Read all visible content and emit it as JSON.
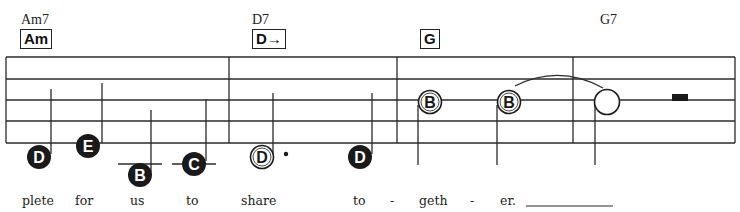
{
  "chords": [
    {
      "name": "Am7",
      "box": "Am",
      "name_x": 21,
      "box_x": 20
    },
    {
      "name": "D7",
      "box": "D→",
      "name_x": 252,
      "box_x": 252
    },
    {
      "name": "",
      "box": "G",
      "name_x": 0,
      "box_x": 420
    },
    {
      "name": "G7",
      "box": "",
      "name_x": 600,
      "box_x": 0
    }
  ],
  "staff": {
    "left": 6,
    "right": 735,
    "lines_y": [
      57,
      79,
      100,
      121,
      143
    ],
    "barlines_x": [
      6,
      229,
      397,
      573,
      735
    ],
    "line_color": "#2a2a2a"
  },
  "notes": [
    {
      "letter": "D",
      "style": "filled",
      "cx": 39,
      "cy": 157,
      "stem": "up"
    },
    {
      "letter": "E",
      "style": "filled",
      "cx": 88,
      "cy": 146,
      "stem": "up"
    },
    {
      "letter": "B",
      "style": "filled",
      "cx": 140,
      "cy": 175,
      "stem": "up",
      "ledger": true
    },
    {
      "letter": "C",
      "style": "filled",
      "cx": 194,
      "cy": 164,
      "stem": "up",
      "ledger": true
    },
    {
      "letter": "D",
      "style": "open",
      "cx": 262,
      "cy": 157,
      "stem": "up",
      "dotted": true
    },
    {
      "letter": "D",
      "style": "filled",
      "cx": 360,
      "cy": 157,
      "stem": "up"
    },
    {
      "letter": "B",
      "style": "open",
      "cx": 430,
      "cy": 102,
      "stem": "down"
    },
    {
      "letter": "B",
      "style": "open",
      "cx": 509,
      "cy": 102,
      "stem": "down"
    },
    {
      "letter": "",
      "style": "open",
      "cx": 607,
      "cy": 102,
      "stem": "down"
    }
  ],
  "rest": {
    "type": "half-rest",
    "x": 672,
    "y": 94,
    "w": 16,
    "h": 7
  },
  "tie": {
    "from_x": 515,
    "to_x": 603,
    "y": 87
  },
  "lyrics": [
    {
      "text": "plete",
      "x": 22
    },
    {
      "text": "for",
      "x": 75
    },
    {
      "text": "us",
      "x": 130
    },
    {
      "text": "to",
      "x": 186
    },
    {
      "text": "share",
      "x": 241
    },
    {
      "text": "to",
      "x": 353
    },
    {
      "text": "-",
      "x": 390
    },
    {
      "text": "geth",
      "x": 419
    },
    {
      "text": "-",
      "x": 470
    },
    {
      "text": "er.",
      "x": 500
    }
  ],
  "extender": {
    "x1": 526,
    "x2": 613,
    "y": 206
  }
}
